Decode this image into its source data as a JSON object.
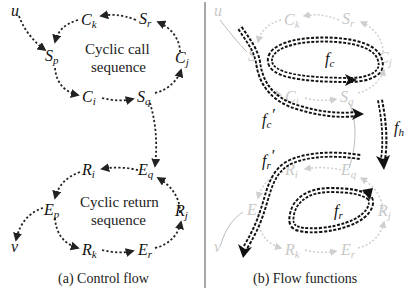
{
  "panel_a": {
    "caption": "(a) Control flow",
    "call_cycle_label_line1": "Cyclic call",
    "call_cycle_label_line2": "sequence",
    "return_cycle_label_line1": "Cyclic return",
    "return_cycle_label_line2": "sequence",
    "nodes": {
      "u": "u",
      "v": "v",
      "Ck": {
        "base": "C",
        "sub": "k"
      },
      "Sr": {
        "base": "S",
        "sub": "r"
      },
      "Sp": {
        "base": "S",
        "sub": "p"
      },
      "Cj": {
        "base": "C",
        "sub": "j"
      },
      "Ci": {
        "base": "C",
        "sub": "i"
      },
      "Sq": {
        "base": "S",
        "sub": "q"
      },
      "Ri": {
        "base": "R",
        "sub": "i"
      },
      "Eq": {
        "base": "E",
        "sub": "q"
      },
      "Ep": {
        "base": "E",
        "sub": "p"
      },
      "Rj": {
        "base": "R",
        "sub": "j"
      },
      "Rk": {
        "base": "R",
        "sub": "k"
      },
      "Er": {
        "base": "E",
        "sub": "r"
      }
    }
  },
  "panel_b": {
    "caption": "(b) Flow functions",
    "flow_functions": {
      "fc": {
        "base": "f",
        "sub": "c",
        "prime": ""
      },
      "fc_prime": {
        "base": "f",
        "sub": "c",
        "prime": "′"
      },
      "fh": {
        "base": "f",
        "sub": "h",
        "prime": ""
      },
      "fr_prime": {
        "base": "f",
        "sub": "r",
        "prime": "′"
      },
      "fr": {
        "base": "f",
        "sub": "r",
        "prime": ""
      }
    },
    "nodes": {
      "u": "u",
      "v": "v",
      "Ck": {
        "base": "C",
        "sub": "k"
      },
      "Sr": {
        "base": "S",
        "sub": "r"
      },
      "Sp": {
        "base": "S",
        "sub": "p"
      },
      "Cj": {
        "base": "C",
        "sub": "j"
      },
      "Ci": {
        "base": "C",
        "sub": "i"
      },
      "Sq": {
        "base": "S",
        "sub": "q"
      },
      "Ri": {
        "base": "R",
        "sub": "i"
      },
      "Eq": {
        "base": "E",
        "sub": "q"
      },
      "Ep": {
        "base": "E",
        "sub": "p"
      },
      "Rj": {
        "base": "R",
        "sub": "j"
      },
      "Rk": {
        "base": "R",
        "sub": "k"
      },
      "Er": {
        "base": "E",
        "sub": "r"
      }
    }
  },
  "colors": {
    "ink": "#111111",
    "faint": "#c8c8c8",
    "divider": "#888888",
    "background": "#ffffff"
  }
}
